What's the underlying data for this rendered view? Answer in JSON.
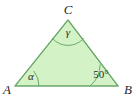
{
  "figure": {
    "type": "triangle-with-angle-marks",
    "background_color": "#ffffff",
    "fill_color": "#d3f2c6",
    "stroke_color": "#6aa86a",
    "label_color": "#2b2b2b",
    "vertices": [
      {
        "name": "A",
        "label": "A",
        "x": 15,
        "y": 86,
        "label_x": 3,
        "label_y": 94
      },
      {
        "name": "B",
        "label": "B",
        "x": 118,
        "y": 86,
        "label_x": 124,
        "label_y": 94
      },
      {
        "name": "C",
        "label": "C",
        "x": 68,
        "y": 20,
        "label_x": 63,
        "label_y": 14
      }
    ],
    "angles": [
      {
        "at_vertex": "A",
        "label": "α",
        "label_x": 31,
        "label_y": 80,
        "arc_radius": 24,
        "is_numeric": false
      },
      {
        "at_vertex": "B",
        "label": "50°",
        "label_x": 92,
        "label_y": 78,
        "arc_radius": 28,
        "is_numeric": true
      },
      {
        "at_vertex": "C",
        "label": "γ",
        "label_x": 65,
        "label_y": 36,
        "arc_radius": 21,
        "is_numeric": false
      }
    ],
    "sides": [
      {
        "name": "AB",
        "from": "A",
        "to": "B"
      },
      {
        "name": "BC",
        "from": "B",
        "to": "C"
      },
      {
        "name": "CA",
        "from": "C",
        "to": "A"
      }
    ]
  }
}
